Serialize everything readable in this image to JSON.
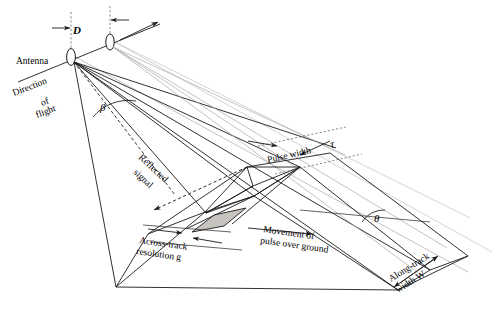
{
  "figure": {
    "type": "technical-diagram",
    "background_color": "#ffffff",
    "line_color": "#1a1a1a",
    "accent_fill": "#b4b0ab"
  },
  "labels": {
    "antenna": "Antenna",
    "direction_of_flight_line1": "Direction",
    "direction_of_flight_line2": "of",
    "direction_of_flight_line3": "flight",
    "antenna_separation": "D",
    "beam_angle": "β",
    "reflected_signal_line1": "Reflected",
    "reflected_signal_line2": "signal",
    "pulse_width": "Pulse width",
    "pulse_width_symbol": "τ",
    "across_track_line1": "Across-track",
    "across_track_line2": "resolution g",
    "movement_line1": "Movement of",
    "movement_line2": "pulse over ground",
    "depression_angle": "θ",
    "along_track_line1": "Along-track",
    "along_track_line2": "width W"
  },
  "annotations": [
    {
      "name": "antenna-position-1",
      "role": "radar antenna at first pulse"
    },
    {
      "name": "antenna-position-2",
      "role": "radar antenna at second pulse"
    },
    {
      "name": "flight-path",
      "role": "platform track line"
    },
    {
      "name": "resolution-cell",
      "role": "shaded ground resolution cell"
    },
    {
      "name": "ground-swath",
      "role": "illuminated footprint on ground"
    }
  ]
}
